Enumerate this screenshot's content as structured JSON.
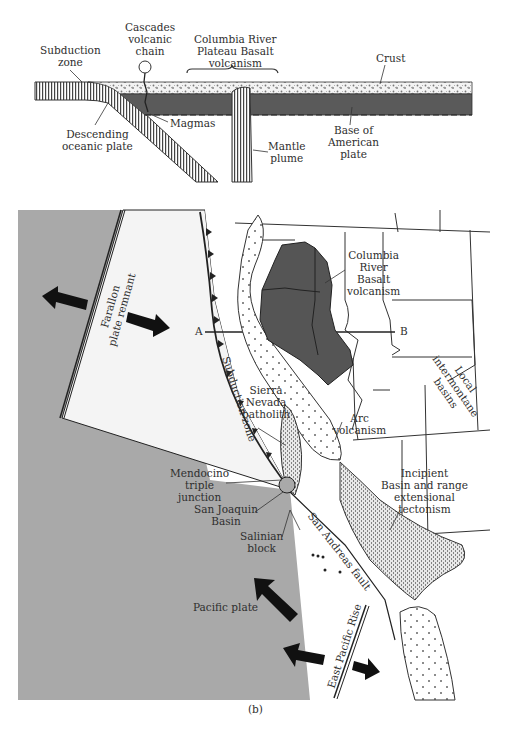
{
  "cross_section": {
    "labels": {
      "subduction_zone": "Subduction\nzone",
      "cascades": "Cascades\nvolcanic\nchain",
      "columbia_plateau": "Columbia River\nPlateau Basalt\nvolcanism",
      "crust": "Crust",
      "magmas": "Magmas",
      "descending_plate": "Descending\noceanic plate",
      "mantle_plume": "Mantle\nplume",
      "base_american_plate": "Base of\nAmerican\nplate"
    }
  },
  "map": {
    "labels": {
      "farallon": "Farallon\nplate remnant",
      "point_a": "A",
      "point_b": "B",
      "columbia_basalt": "Columbia\nRiver\nBasalt\nvolcanism",
      "local_basins": "Local\nintermontane\nbasins",
      "subduction_zone": "Subduction zone",
      "sierra_nevada": "Sierra\nNevada\nbatholith",
      "arc_volcanism": "Arc\nvolcanism",
      "mendocino": "Mendocino\ntriple\njunction",
      "san_joaquin": "San Joaquin\nBasin",
      "salinian": "Salinian\nblock",
      "incipient_basin": "Incipient\nBasin and range\nextensional\ntectonism",
      "san_andreas": "San Andreas fault",
      "pacific_plate": "Pacific plate",
      "east_pacific_rise": "East Pacific Rise"
    },
    "colors": {
      "ocean": "#a9a9a9",
      "basalt": "#555555",
      "land": "#ffffff",
      "line": "#333333"
    }
  },
  "caption": "(b)"
}
